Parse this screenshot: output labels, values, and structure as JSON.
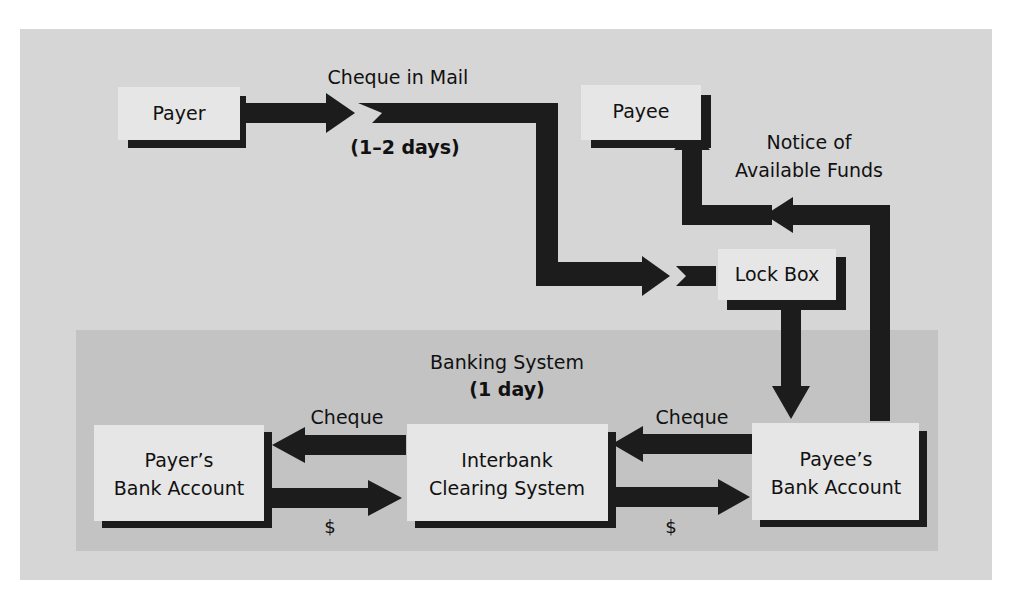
{
  "colors": {
    "outer_panel": "#d6d6d6",
    "banking_panel": "#c3c3c3",
    "box_fill": "#e6e6e6",
    "arrow": "#1c1c1c",
    "text": "#111111"
  },
  "nodes": {
    "payer": "Payer",
    "payee": "Payee",
    "lock_box": "Lock Box",
    "payers_bank": [
      "Payer’s",
      "Bank Account"
    ],
    "interbank": [
      "Interbank",
      "Clearing System"
    ],
    "payees_bank": [
      "Payee’s",
      "Bank Account"
    ]
  },
  "labels": {
    "cheque_in_mail": "Cheque in Mail",
    "mail_days": "(1–2 days)",
    "notice": [
      "Notice of",
      "Available Funds"
    ],
    "banking_system": "Banking System",
    "banking_days": "(1 day)",
    "cheque_left": "Cheque",
    "cheque_right": "Cheque",
    "dollar_left": "$",
    "dollar_right": "$"
  },
  "flows": [
    {
      "from": "Payer",
      "to": "Lock Box",
      "label": "Cheque in Mail (1–2 days)"
    },
    {
      "from": "Lock Box",
      "to": "Payee’s Bank Account",
      "label": ""
    },
    {
      "from": "Payee’s Bank Account",
      "to": "Payee",
      "label": "Notice of Available Funds"
    },
    {
      "from": "Payee’s Bank Account",
      "to": "Interbank Clearing System",
      "label": "Cheque"
    },
    {
      "from": "Interbank Clearing System",
      "to": "Payer’s Bank Account",
      "label": "Cheque"
    },
    {
      "from": "Payer’s Bank Account",
      "to": "Interbank Clearing System",
      "label": "$"
    },
    {
      "from": "Interbank Clearing System",
      "to": "Payee’s Bank Account",
      "label": "$"
    }
  ]
}
